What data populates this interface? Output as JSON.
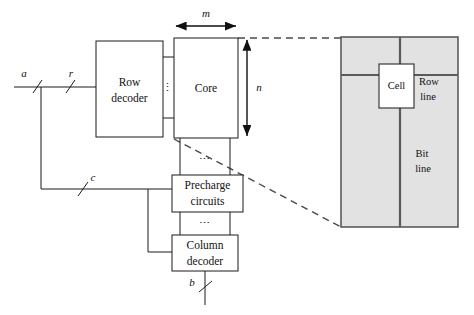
{
  "diagram": {
    "blocks": {
      "row_decoder": {
        "line1": "Row",
        "line2": "decoder"
      },
      "core": {
        "label": "Core"
      },
      "precharge": {
        "line1": "Precharge",
        "line2": "circuits"
      },
      "column_decoder": {
        "line1": "Column",
        "line2": "decoder"
      },
      "cell": {
        "label": "Cell"
      }
    },
    "signals": {
      "address": "a",
      "row": "r",
      "column": "c",
      "bits": "b"
    },
    "dimensions": {
      "width": "m",
      "height": "n"
    },
    "detail": {
      "row_line_1": "Row",
      "row_line_2": "line",
      "bit_line_1": "Bit",
      "bit_line_2": "line"
    },
    "ellipsis": {
      "vertical": "⋮",
      "horizontal": "⋯"
    },
    "colors": {
      "stroke": "#1a1a1a",
      "panel_fill": "#e2e2e2",
      "panel_stroke": "#5a5a5a",
      "dash_stroke": "#4a4a4a",
      "background": "#ffffff"
    }
  }
}
